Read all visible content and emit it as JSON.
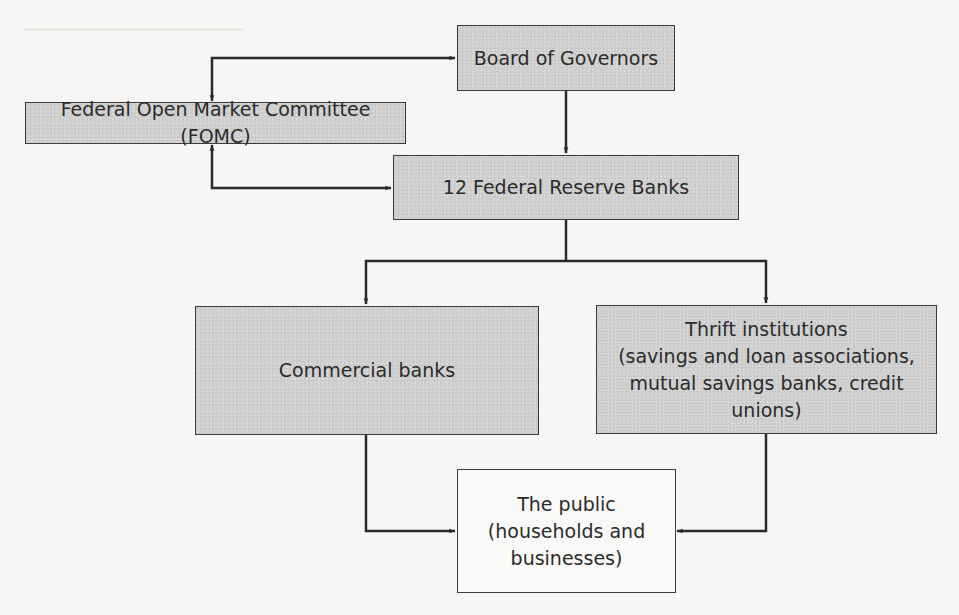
{
  "diagram": {
    "type": "organizational-flow",
    "nodes": [
      {
        "id": "board",
        "label_lines": [
          "Board of Governors"
        ],
        "fill": "shaded"
      },
      {
        "id": "fomc",
        "label_lines": [
          "Federal Open Market Committee (FOMC)"
        ],
        "fill": "shaded"
      },
      {
        "id": "frb",
        "label_lines": [
          "12 Federal Reserve Banks"
        ],
        "fill": "shaded"
      },
      {
        "id": "commercial",
        "label_lines": [
          "Commercial banks"
        ],
        "fill": "shaded"
      },
      {
        "id": "thrift",
        "label_lines": [
          "Thrift institutions",
          "(savings and loan associations,",
          "mutual savings banks, credit unions)"
        ],
        "fill": "shaded"
      },
      {
        "id": "public",
        "label_lines": [
          "The public",
          "(households and",
          "businesses)"
        ],
        "fill": "plain"
      }
    ],
    "edges": [
      {
        "from": "board",
        "to": "fomc",
        "bidirectional": true
      },
      {
        "from": "fomc",
        "to": "frb",
        "bidirectional": true
      },
      {
        "from": "board",
        "to": "frb",
        "bidirectional": false
      },
      {
        "from": "frb",
        "to": "commercial",
        "bidirectional": false
      },
      {
        "from": "frb",
        "to": "thrift",
        "bidirectional": false
      },
      {
        "from": "commercial",
        "to": "public",
        "bidirectional": false
      },
      {
        "from": "thrift",
        "to": "public",
        "bidirectional": false
      }
    ]
  },
  "colors": {
    "box_fill": "#cfcfcf",
    "public_fill": "#f9f9f8",
    "line": "#2a2a2a",
    "page": "#f7f6f4"
  }
}
